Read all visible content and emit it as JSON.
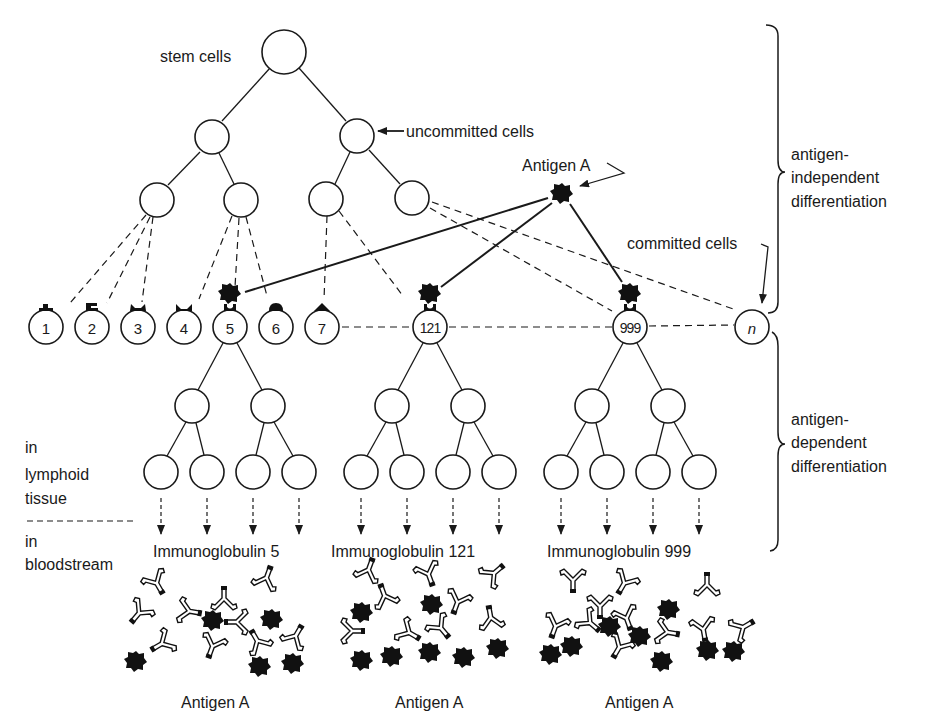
{
  "labels": {
    "stem_cells": "stem cells",
    "uncommitted_cells": "uncommitted cells",
    "antigen_top": "Antigen A",
    "committed_cells": "committed cells",
    "independent_1": "antigen-",
    "independent_2": "independent",
    "independent_3": "differentiation",
    "dependent_1": "antigen-",
    "dependent_2": "dependent",
    "dependent_3": "differentiation",
    "lymphoid_1": "in",
    "lymphoid_2": "lymphoid",
    "lymphoid_3": "tissue",
    "blood_1": "in",
    "blood_2": "bloodstream"
  },
  "committed_cells": [
    {
      "label": "1",
      "receptor": "type-1",
      "antigen_bound": false
    },
    {
      "label": "2",
      "receptor": "type-2",
      "antigen_bound": false
    },
    {
      "label": "3",
      "receptor": "type-3",
      "antigen_bound": false
    },
    {
      "label": "4",
      "receptor": "type-4",
      "antigen_bound": false
    },
    {
      "label": "5",
      "receptor": "type-5",
      "antigen_bound": true
    },
    {
      "label": "6",
      "receptor": "type-6",
      "antigen_bound": false
    },
    {
      "label": "7",
      "receptor": "type-7",
      "antigen_bound": false
    },
    {
      "label": "121",
      "receptor": "type-5",
      "antigen_bound": true
    },
    {
      "label": "999",
      "receptor": "type-5",
      "antigen_bound": true
    },
    {
      "label": "n",
      "receptor": "none",
      "antigen_bound": false
    }
  ],
  "clones": [
    {
      "label": "Immunoglobulin 5",
      "bottom_label": "Antigen A"
    },
    {
      "label": "Immunoglobulin 121",
      "bottom_label": "Antigen A"
    },
    {
      "label": "Immunoglobulin 999",
      "bottom_label": "Antigen A"
    }
  ]
}
